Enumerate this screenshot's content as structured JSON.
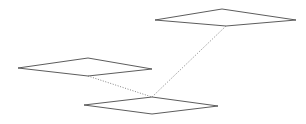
{
  "figure": {
    "background_color": "#ffffff",
    "outline_color": "#4a4a4a",
    "connector_color": "#6e6e6e",
    "width": 306,
    "height": 124,
    "planes": [
      {
        "name": "upper-right-plane",
        "points": "155,20 222,9 296,20 226,26",
        "vertices": [
          {
            "label": "left",
            "x": 155,
            "y": 20
          },
          {
            "label": "top",
            "x": 222,
            "y": 9
          },
          {
            "label": "right",
            "x": 296,
            "y": 20
          },
          {
            "label": "bottom",
            "x": 226,
            "y": 26
          }
        ]
      },
      {
        "name": "middle-left-plane",
        "points": "18,68 88,58 152,69 88,76",
        "vertices": [
          {
            "label": "left",
            "x": 18,
            "y": 68
          },
          {
            "label": "top",
            "x": 88,
            "y": 58
          },
          {
            "label": "right",
            "x": 152,
            "y": 69
          },
          {
            "label": "bottom",
            "x": 88,
            "y": 76
          }
        ]
      },
      {
        "name": "lower-center-plane",
        "points": "84,105 152,97 218,106 152,114",
        "vertices": [
          {
            "label": "left",
            "x": 84,
            "y": 105
          },
          {
            "label": "top",
            "x": 152,
            "y": 97
          },
          {
            "label": "right",
            "x": 218,
            "y": 106
          },
          {
            "label": "bottom",
            "x": 152,
            "y": 114
          }
        ]
      }
    ],
    "connectors": [
      {
        "name": "connector-left-to-lower",
        "x1": 88,
        "y1": 76,
        "x2": 152,
        "y2": 97
      },
      {
        "name": "connector-upper-to-lower",
        "x1": 226,
        "y1": 26,
        "x2": 152,
        "y2": 97
      }
    ]
  }
}
